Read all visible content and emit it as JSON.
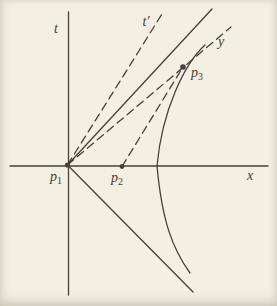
{
  "colors": {
    "paper": "#f3efe3",
    "ink": "#45413a"
  },
  "diagram": {
    "type": "spacetime-diagram",
    "axes": {
      "vertical_label": "t",
      "horizontal_label": "x"
    },
    "lines": {
      "t_prime_label": "t′",
      "y_label": "y"
    },
    "points": {
      "p1": {
        "base": "p",
        "sub": "1"
      },
      "p2": {
        "base": "p",
        "sub": "2"
      },
      "p3": {
        "base": "p",
        "sub": "3"
      }
    }
  }
}
